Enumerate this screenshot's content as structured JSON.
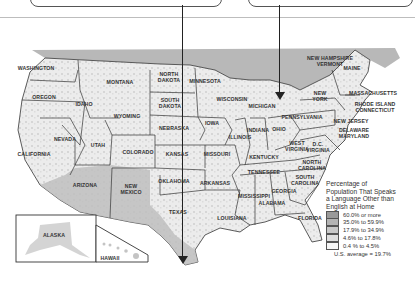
{
  "map": {
    "title": "Percentage of Population That Speaks a Language Other than English at Home",
    "legend": {
      "title_lines": [
        "Percentage of",
        "Population That Speaks",
        "a Language Other than",
        "English at Home"
      ],
      "items": [
        {
          "label": "60.0% or more",
          "color": "#9a9a9a"
        },
        {
          "label": "35.0% to 59.9%",
          "color": "#b4b4b4"
        },
        {
          "label": "17.9% to 34.9%",
          "color": "#c8c8c8"
        },
        {
          "label": "4.6% to 17.8%",
          "color": "#dedede"
        },
        {
          "label": "0.4 % to 4.5%",
          "color": "#f6f6f6"
        }
      ],
      "average": "U.S. average = 19.7%"
    },
    "states": [
      {
        "name": "WASHINGTON",
        "x": 36,
        "y": 69
      },
      {
        "name": "OREGON",
        "x": 44,
        "y": 98
      },
      {
        "name": "IDAHO",
        "x": 84,
        "y": 105
      },
      {
        "name": "MONTANA",
        "x": 120,
        "y": 83
      },
      {
        "name": "WYOMING",
        "x": 127,
        "y": 117
      },
      {
        "name": "NORTH\nDAKOTA",
        "x": 169,
        "y": 78
      },
      {
        "name": "SOUTH\nDAKOTA",
        "x": 170,
        "y": 104
      },
      {
        "name": "MINNESOTA",
        "x": 205,
        "y": 82
      },
      {
        "name": "WISCONSIN",
        "x": 232,
        "y": 100
      },
      {
        "name": "MICHIGAN",
        "x": 262,
        "y": 107
      },
      {
        "name": "NEBRASKA",
        "x": 174,
        "y": 129
      },
      {
        "name": "IOWA",
        "x": 212,
        "y": 124
      },
      {
        "name": "ILLINOIS",
        "x": 240,
        "y": 138
      },
      {
        "name": "INDIANA",
        "x": 258,
        "y": 131
      },
      {
        "name": "OHIO",
        "x": 279,
        "y": 130
      },
      {
        "name": "NEVADA",
        "x": 65,
        "y": 140
      },
      {
        "name": "UTAH",
        "x": 98,
        "y": 146
      },
      {
        "name": "COLORADO",
        "x": 138,
        "y": 153
      },
      {
        "name": "KANSAS",
        "x": 177,
        "y": 155
      },
      {
        "name": "MISSOURI",
        "x": 217,
        "y": 155
      },
      {
        "name": "KENTUCKY",
        "x": 264,
        "y": 158
      },
      {
        "name": "WEST\nVIRGINIA",
        "x": 297,
        "y": 147
      },
      {
        "name": "D.C.\nVIRGINIA",
        "x": 318,
        "y": 148
      },
      {
        "name": "CALIFORNIA",
        "x": 34,
        "y": 155
      },
      {
        "name": "ARIZONA",
        "x": 85,
        "y": 186
      },
      {
        "name": "NEW\nMEXICO",
        "x": 131,
        "y": 190
      },
      {
        "name": "OKLAHOMA",
        "x": 174,
        "y": 182
      },
      {
        "name": "ARKANSAS",
        "x": 215,
        "y": 184
      },
      {
        "name": "TENNESSEE",
        "x": 264,
        "y": 173
      },
      {
        "name": "NORTH\nCAROLINA",
        "x": 312,
        "y": 166
      },
      {
        "name": "SOUTH\nCAROLINA",
        "x": 305,
        "y": 181
      },
      {
        "name": "TEXAS",
        "x": 178,
        "y": 213
      },
      {
        "name": "MISSISSIPPI",
        "x": 254,
        "y": 197
      },
      {
        "name": "ALABAMA",
        "x": 272,
        "y": 204
      },
      {
        "name": "GEORGIA",
        "x": 284,
        "y": 192
      },
      {
        "name": "LOUISIANA",
        "x": 232,
        "y": 219
      },
      {
        "name": "FLORIDA",
        "x": 310,
        "y": 219
      },
      {
        "name": "NEW HAMPSHIRE\nVERMONT",
        "x": 330,
        "y": 62
      },
      {
        "name": "MAINE",
        "x": 352,
        "y": 69
      },
      {
        "name": "NEW\nYORK",
        "x": 320,
        "y": 97
      },
      {
        "name": "MASSACHUSETTS",
        "x": 373,
        "y": 94
      },
      {
        "name": "RHODE ISLAND\nCONNECTICUT",
        "x": 375,
        "y": 108
      },
      {
        "name": "PENNSYLVANIA",
        "x": 302,
        "y": 118
      },
      {
        "name": "NEW JERSEY",
        "x": 351,
        "y": 122
      },
      {
        "name": "DELAWARE\nMARYLAND",
        "x": 354,
        "y": 134
      },
      {
        "name": "ALASKA",
        "x": 54,
        "y": 236
      },
      {
        "name": "HAWAII",
        "x": 110,
        "y": 259
      }
    ]
  }
}
